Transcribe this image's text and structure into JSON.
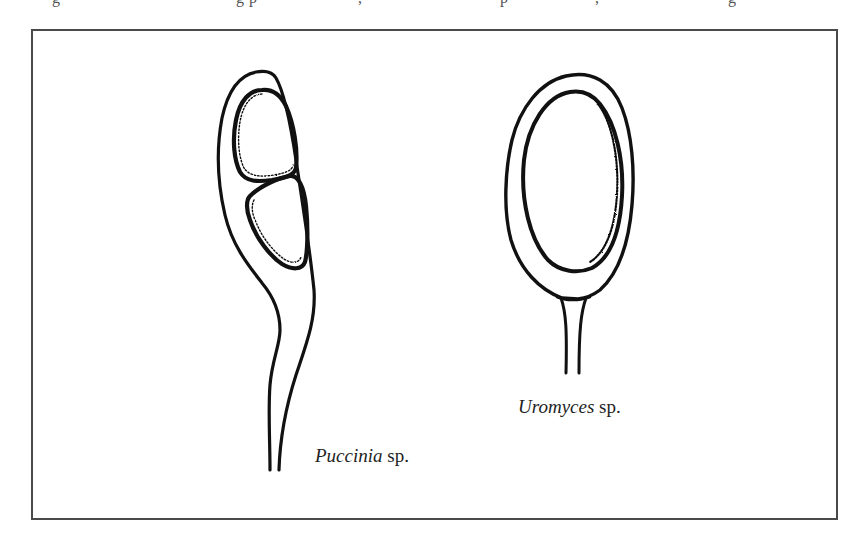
{
  "caption_fragment": {
    "text_pieces": [
      "g",
      "g p",
      ",",
      "p",
      ",",
      "g"
    ]
  },
  "figure": {
    "specimens": [
      {
        "id": "puccinia",
        "genus": "Puccinia",
        "suffix": " sp.",
        "description": "two-celled teliospore on long tapering pedicel"
      },
      {
        "id": "uromyces",
        "genus": "Uromyces",
        "suffix": " sp.",
        "description": "one-celled oval teliospore on short pedicel"
      }
    ]
  },
  "colors": {
    "ink": "#111111",
    "frame": "#4a4a4a",
    "background": "#ffffff"
  }
}
